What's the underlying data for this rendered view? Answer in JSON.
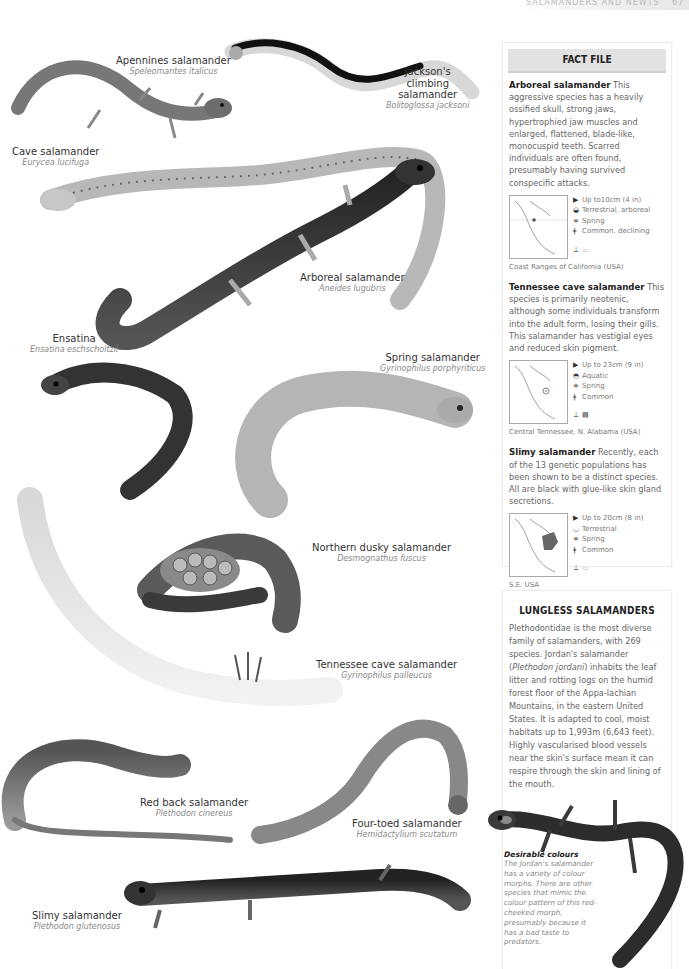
{
  "running_head": {
    "text": "SALAMANDERS AND NEWTS",
    "page_number": "67"
  },
  "illustrations": [
    {
      "common": "Apennines salamander",
      "latin": "Speleomantes italicus"
    },
    {
      "common": "Jackson's climbing salamander",
      "common_lines": [
        "Jackson's",
        "climbing",
        "salamander"
      ],
      "latin": "Bolitoglossa jacksoni"
    },
    {
      "common": "Cave salamander",
      "latin": "Eurycea lucifuga"
    },
    {
      "common": "Arboreal salamander",
      "latin": "Aneides lugubris"
    },
    {
      "common": "Ensatina",
      "latin": "Ensatina eschscholtzii"
    },
    {
      "common": "Spring salamander",
      "latin": "Gyrinophilus porphyriticus"
    },
    {
      "common": "Northern dusky salamander",
      "latin": "Desmognathus fuscus"
    },
    {
      "common": "Tennessee cave salamander",
      "latin": "Gyrinophilus palleucus"
    },
    {
      "common": "Red back salamander",
      "latin": "Plethodon cinereus"
    },
    {
      "common": "Four-toed salamander",
      "latin": "Hemidactylium scutatum"
    },
    {
      "common": "Slimy salamander",
      "latin": "Plethodon glutenosus"
    }
  ],
  "fact_file": {
    "title": "FACT FILE",
    "entries": [
      {
        "name": "Arboreal salamander",
        "text": "This aggressive species has a heavily ossified skull, strong jaws, hypertrophied jaw muscles and enlarged, flattened, blade-like, monocuspid teeth. Scarred individuals are often found, presumably having survived conspecific attacks.",
        "size": "Up to10cm (4 in)",
        "habitat": "Terrestrial, arboreal",
        "breeding": "Spring",
        "status": "Common, declining",
        "region": "Coast Ranges of California (USA)"
      },
      {
        "name": "Tennessee cave salamander",
        "text": "This species is primarily neotenic, although some individuals transform into the adult form, losing their gills. This salamander has vestigial eyes and reduced skin pigment.",
        "size": "Up to 23cm (9 in)",
        "habitat": "Aquatic",
        "breeding": "Spring",
        "status": "Common",
        "region": "Central Tennessee, N. Alabama (USA)"
      },
      {
        "name": "Slimy salamander",
        "text": "Recently, each of the 13 genetic populations has been shown to be a distinct species. All are black with glue-like skin gland secretions.",
        "size": "Up to 20cm (8 in)",
        "habitat": "Terrestrial",
        "breeding": "Spring",
        "status": "Common",
        "region": "S.E. USA"
      }
    ]
  },
  "lungless": {
    "title": "LUNGLESS SALAMANDERS",
    "body_before_italic": "Plethodontidae is the most diverse family of salamanders, with 269 species. Jordan's salamander (",
    "italic": "Plethodon jordani",
    "body_after_italic": ") inhabits the leaf litter and rotting logs on the humid forest floor of the Appa-lachian Mountains, in the eastern United States. It is adapted to cool, moist habitats up to 1,993m (6,643 feet). Highly vascularised blood vessels near the skin's surface mean it can respire through the skin and lining of the mouth."
  },
  "caption": {
    "title": "Desirable colours",
    "text": "The Jordan's salamander has a variety of colour morphs. There are other species that mimic the colour pattern of this red-cheeked morph, presumably because it has a bad taste to predators."
  },
  "icons": {
    "size": "size-icon",
    "habitat": "habitat-icon",
    "breeding": "breeding-icon",
    "status": "status-icon"
  }
}
